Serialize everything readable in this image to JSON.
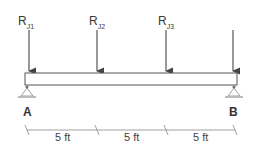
{
  "diagram": {
    "type": "simply-supported-beam",
    "loads": [
      {
        "symbol": "R",
        "subscript": "J1",
        "x": 29
      },
      {
        "symbol": "R",
        "subscript": "J2",
        "x": 97
      },
      {
        "symbol": "R",
        "subscript": "J3",
        "x": 166
      },
      {
        "symbol": "",
        "subscript": "",
        "x": 233
      }
    ],
    "supports": [
      {
        "label": "A"
      },
      {
        "label": "B"
      }
    ],
    "dimensions": [
      {
        "label": "5 ft"
      },
      {
        "label": "5 ft"
      },
      {
        "label": "5 ft"
      }
    ],
    "colors": {
      "line": "#555555",
      "beam_fill": "#ffffff"
    }
  }
}
